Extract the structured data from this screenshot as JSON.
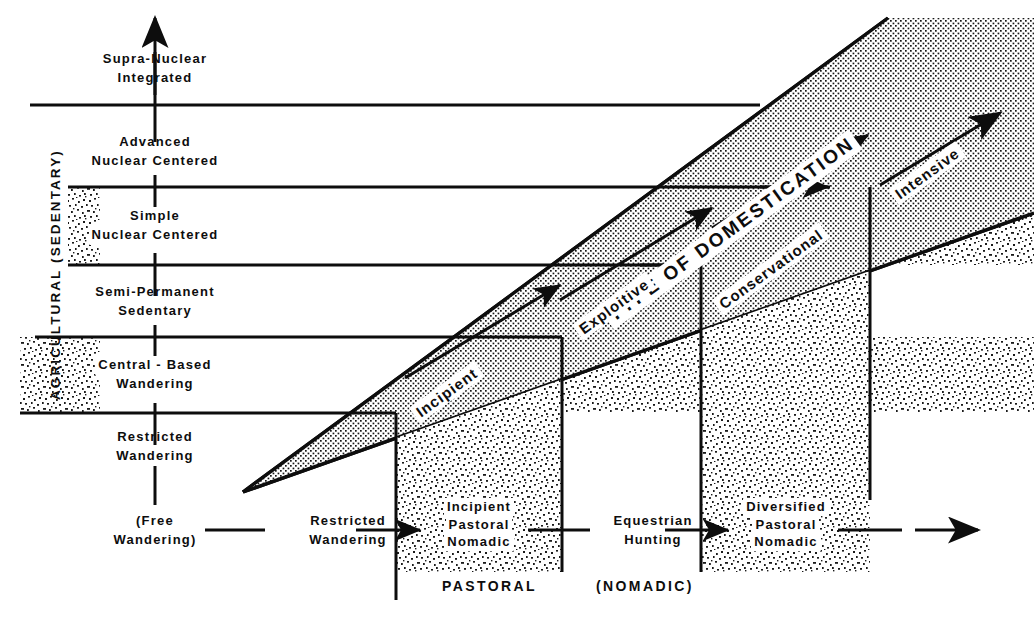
{
  "figure": {
    "title_vertical_axis": "AGRICULTURAL  (SEDENTARY)",
    "bottom_axis_caption_left": "PASTORAL",
    "bottom_axis_caption_right": "(NOMADIC)",
    "band_title": "TYPE  OF  DOMESTICATION"
  },
  "vertical_levels": [
    {
      "id": "supra-nuclear-integrated",
      "line1": "Supra-Nuclear",
      "line2": "Integrated"
    },
    {
      "id": "advanced-nuclear-centered",
      "line1": "Advanced",
      "line2": "Nuclear  Centered"
    },
    {
      "id": "simple-nuclear-centered",
      "line1": "Simple",
      "line2": "Nuclear  Centered"
    },
    {
      "id": "semi-permanent-sedentary",
      "line1": "Semi-Permanent",
      "line2": "Sedentary"
    },
    {
      "id": "central-based-wandering",
      "line1": "Central - Based",
      "line2": "Wandering"
    },
    {
      "id": "restricted-wandering",
      "line1": "Restricted",
      "line2": "Wandering"
    },
    {
      "id": "free-wandering",
      "line1": "(Free",
      "line2": "Wandering)"
    }
  ],
  "horizontal_levels": [
    {
      "id": "restricted-wandering-h",
      "line1": "Restricted",
      "line2": "Wandering",
      "line3": ""
    },
    {
      "id": "incipient-pastoral-nomadic",
      "line1": "Incipient",
      "line2": "Pastoral",
      "line3": "Nomadic"
    },
    {
      "id": "equestrian-hunting",
      "line1": "Equestrian",
      "line2": "Hunting",
      "line3": ""
    },
    {
      "id": "diversified-pastoral-nomadic",
      "line1": "Diversified",
      "line2": "Pastoral",
      "line3": "Nomadic"
    }
  ],
  "domestication_stages": [
    {
      "id": "incipient",
      "label": "Incipient"
    },
    {
      "id": "exploitive",
      "label": "Exploitive"
    },
    {
      "id": "conservational",
      "label": "Conservational"
    },
    {
      "id": "intensive",
      "label": "Intensive"
    }
  ],
  "colors": {
    "ink": "#0d0d0d",
    "paper": "#ffffff",
    "coarse_stipple": "#8e8e8e",
    "fine_stipple": "#9a9a9a"
  }
}
